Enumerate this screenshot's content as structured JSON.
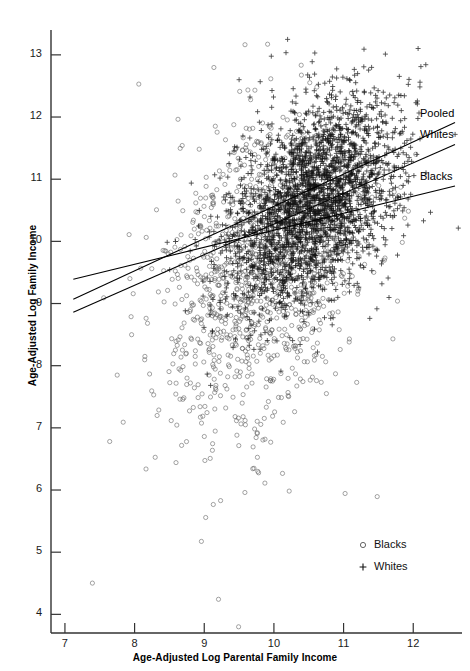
{
  "chart_data": {
    "type": "scatter",
    "title": "",
    "xlabel": "Age-Adjusted Log Parental Family Income",
    "ylabel": "Age-Adjusted Log Family Income",
    "xlim": [
      6.8,
      12.7
    ],
    "ylim": [
      3.7,
      13.4
    ],
    "xticks": [
      7,
      8,
      9,
      10,
      11,
      12
    ],
    "yticks": [
      4,
      5,
      6,
      7,
      8,
      9,
      10,
      11,
      12,
      13
    ],
    "grid": false,
    "legend_position": "bottom-right",
    "series": [
      {
        "name": "Blacks",
        "marker": "circle",
        "color": "#5f5f5f",
        "n_points": 1100,
        "x_mean": 9.75,
        "x_sd": 0.72,
        "y_mean": 9.55,
        "y_sd": 1.25,
        "correlation": 0.3
      },
      {
        "name": "Whites",
        "marker": "plus",
        "color": "#141414",
        "n_points": 2600,
        "x_mean": 10.6,
        "x_sd": 0.62,
        "y_mean": 10.65,
        "y_sd": 0.85,
        "correlation": 0.42
      }
    ],
    "regression_lines": [
      {
        "name": "Pooled",
        "x0": 7.12,
        "y0": 9.07,
        "x1": 12.6,
        "y1": 11.91,
        "slope": 0.518
      },
      {
        "name": "Whites",
        "x0": 7.12,
        "y0": 8.86,
        "x1": 12.6,
        "y1": 11.56,
        "slope": 0.493
      },
      {
        "name": "Blacks",
        "x0": 7.12,
        "y0": 9.39,
        "x1": 12.6,
        "y1": 10.89,
        "slope": 0.274
      }
    ],
    "legend_entries": [
      {
        "label": "Blacks",
        "marker": "circle"
      },
      {
        "label": "Whites",
        "marker": "plus"
      }
    ]
  },
  "axis": {
    "y_title": "Age-Adjusted Log Family Income",
    "x_title": "Age-Adjusted Log Parental Family Income"
  }
}
